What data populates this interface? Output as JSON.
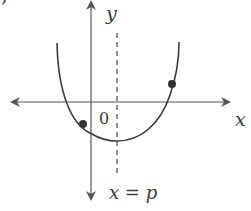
{
  "diagram": {
    "type": "parabola-graph",
    "labels": {
      "y_axis": "y",
      "x_axis": "x",
      "origin": "0",
      "axis_of_symmetry": "x = p",
      "corner_fragment": "’"
    },
    "elements": {
      "x_axis": {
        "from": [
          10,
          102
        ],
        "to": [
          230,
          102
        ],
        "arrows": "both"
      },
      "y_axis": {
        "from": [
          91,
          0
        ],
        "to": [
          91,
          200
        ],
        "arrows": "both"
      },
      "symmetry_line": {
        "x": 117,
        "y_from": 33,
        "y_to": 177,
        "style": "dashed"
      },
      "parabola": {
        "left_top": [
          57,
          43
        ],
        "vertex": [
          117,
          141
        ],
        "right_top": [
          179,
          42
        ]
      },
      "points": [
        {
          "name": "left-point",
          "x": 83,
          "y": 124
        },
        {
          "name": "right-point",
          "x": 172,
          "y": 84
        }
      ]
    },
    "colors": {
      "stroke": "#3a3a3a",
      "axis": "#555555",
      "background": "#ffffff"
    }
  }
}
